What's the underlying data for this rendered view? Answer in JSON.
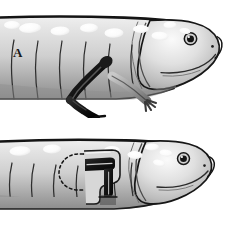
{
  "figure": {
    "background_color": "#ffffff",
    "width": 235,
    "height": 237,
    "panels": [
      {
        "id": "A",
        "label": "A",
        "caption_text": "A",
        "description": "Larval salamander with a darkly pigmented grafted forelimb and a normal lighter hindlimb",
        "subject": "salamander-larva",
        "features": {
          "skin_base_color": "#d9d9d9",
          "skin_shadow_color": "#8a8a8a",
          "outline_color": "#1a1a1a",
          "dorsal_spots": {
            "color": "#f7f7f7",
            "count": 9,
            "shape": "oval"
          },
          "costal_grooves": 6,
          "eye": {
            "pupil_color": "#1a1a1a",
            "iris_color": "#6e6e6e",
            "highlight_color": "#ffffff"
          },
          "grafted_limb": {
            "color": "#141414",
            "label": "dark pigmented graft limb",
            "digits": 4
          },
          "host_limb": {
            "color": "#9e9e9e",
            "label": "normal host limb",
            "digits": 4
          }
        }
      },
      {
        "id": "B",
        "label": "B",
        "caption_text": "B",
        "description": "Larval salamander with a dashed circle marking the host limb bud site and a dark L-shaped graft implanted in the flank",
        "subject": "salamander-larva",
        "features": {
          "skin_base_color": "#d9d9d9",
          "skin_shadow_color": "#8a8a8a",
          "outline_color": "#1a1a1a",
          "dorsal_spots": {
            "color": "#f7f7f7",
            "count": 7,
            "shape": "oval"
          },
          "costal_grooves": 6,
          "eye": {
            "pupil_color": "#1a1a1a",
            "iris_color": "#6e6e6e",
            "highlight_color": "#ffffff"
          },
          "graft_site_marker": {
            "style": "dashed",
            "shape": "circle",
            "stroke_color": "#1a1a1a",
            "label": "host limb bud site"
          },
          "implanted_graft": {
            "color": "#141414",
            "shape": "bent L-shaped limb stump",
            "label": "implanted dark graft"
          }
        }
      }
    ]
  }
}
